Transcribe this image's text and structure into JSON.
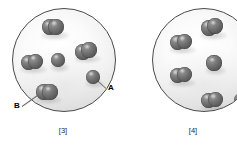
{
  "figure": {
    "background_color": "#ffffff",
    "particle_color": "#6a6a6a",
    "vessel_outline_color": "#4a4a4a"
  },
  "callouts": [
    {
      "label": "A",
      "x": 108,
      "y": 84,
      "target_x": 93,
      "target_y": 76,
      "description": "points to a single atom at the right edge of vessel 3"
    },
    {
      "label": "B",
      "x": 14,
      "y": 102,
      "target_x": 46,
      "target_y": 89,
      "description": "points to a diatomic molecule at the lower left of vessel 3"
    }
  ],
  "panels": [
    {
      "caption": "[3]",
      "caption_x": 63,
      "caption_y": 127,
      "vessel": {
        "x": 12,
        "y": 8,
        "size": 104
      },
      "species": [
        {
          "type": "diatomic",
          "atoms": 2
        },
        {
          "type": "diatomic",
          "atoms": 2
        },
        {
          "type": "diatomic",
          "atoms": 2
        },
        {
          "type": "diatomic",
          "atoms": 2
        },
        {
          "type": "monatomic",
          "atoms": 1
        },
        {
          "type": "monatomic",
          "atoms": 1
        }
      ],
      "counts": {
        "diatomic_molecules": 4,
        "single_atoms": 2,
        "total_atoms": 10
      },
      "particles": [
        {
          "kind": "diatomic",
          "cx": 52,
          "cy": 26,
          "r": 8.0,
          "gap": 7.0,
          "angle": -6
        },
        {
          "kind": "diatomic",
          "cx": 31,
          "cy": 61,
          "r": 7.6,
          "gap": 6.8,
          "angle": -12
        },
        {
          "kind": "diatomic",
          "cx": 85,
          "cy": 50,
          "r": 7.8,
          "gap": 6.8,
          "angle": -20
        },
        {
          "kind": "diatomic",
          "cx": 46,
          "cy": 91,
          "r": 7.8,
          "gap": 6.6,
          "angle": 4
        },
        {
          "kind": "monatomic",
          "cx": 57,
          "cy": 59,
          "r": 7.4,
          "gap": 0,
          "angle": 0
        },
        {
          "kind": "monatomic",
          "cx": 92,
          "cy": 76,
          "r": 7.0,
          "gap": 0,
          "angle": 0
        }
      ]
    },
    {
      "caption": "[4]",
      "caption_x": 193,
      "caption_y": 127,
      "vessel": {
        "x": 152,
        "y": 8,
        "size": 104
      },
      "species": [
        {
          "type": "diatomic",
          "atoms": 2
        },
        {
          "type": "diatomic",
          "atoms": 2
        },
        {
          "type": "diatomic",
          "atoms": 2
        },
        {
          "type": "diatomic",
          "atoms": 2
        },
        {
          "type": "monatomic",
          "atoms": 1
        },
        {
          "type": "monatomic",
          "atoms": 1
        }
      ],
      "counts": {
        "diatomic_molecules": 4,
        "single_atoms": 2,
        "total_atoms": 10
      },
      "particles": [
        {
          "kind": "diatomic",
          "cx": 211,
          "cy": 26,
          "r": 8.0,
          "gap": 6.8,
          "angle": -14
        },
        {
          "kind": "diatomic",
          "cx": 180,
          "cy": 41,
          "r": 7.8,
          "gap": 6.8,
          "angle": -8
        },
        {
          "kind": "diatomic",
          "cx": 180,
          "cy": 74,
          "r": 7.8,
          "gap": 6.8,
          "angle": -10
        },
        {
          "kind": "diatomic",
          "cx": 211,
          "cy": 99,
          "r": 7.8,
          "gap": 6.8,
          "angle": -6
        },
        {
          "kind": "monatomic",
          "cx": 213,
          "cy": 62,
          "r": 7.6,
          "gap": 0,
          "angle": 0
        },
        {
          "kind": "monatomic",
          "cx": 240,
          "cy": 99,
          "r": 7.0,
          "gap": 0,
          "angle": 0
        }
      ]
    }
  ]
}
